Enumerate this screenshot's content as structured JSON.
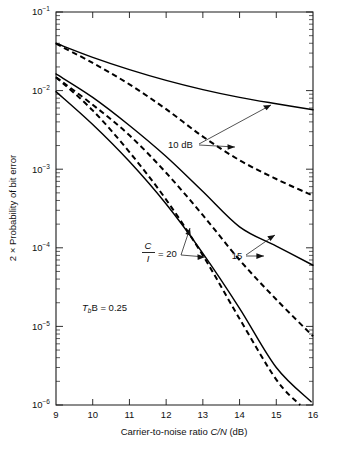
{
  "figure": {
    "background_color": "#ffffff",
    "line_color": "#000000"
  },
  "axes": {
    "x_title_plain_1": "Carrier-to-noise ratio ",
    "x_title_italic": "C/N",
    "x_title_plain_2": " (dB)",
    "y_title": "2 × Probability of bit error",
    "x_ticks": [
      "9",
      "10",
      "11",
      "12",
      "13",
      "14",
      "15",
      "16"
    ],
    "y_tick_mantissa": "10",
    "y_ticks_exponent": [
      "−1",
      "−2",
      "−3",
      "−4",
      "−5",
      "−6"
    ]
  },
  "annotations": {
    "ten_db": "10 dB",
    "ci_numerator": "C",
    "ci_denominator": "I",
    "ci_value": "= 20",
    "fifteen": "15",
    "tsb_symbol": "T",
    "tsb_subscript": "b",
    "tsb_rest": "B = 0.25"
  },
  "chart_data": {
    "type": "line",
    "title": "",
    "xlabel": "Carrier-to-noise ratio C/N (dB)",
    "ylabel": "2 × Probability of bit error",
    "xlim": [
      9,
      16
    ],
    "ylim": [
      1e-06,
      0.1
    ],
    "yscale": "log",
    "xscale": "linear",
    "grid": false,
    "legend": "annotated-inline",
    "xticks": [
      9,
      10,
      11,
      12,
      13,
      14,
      15,
      16
    ],
    "yticks": [
      0.1,
      0.01,
      0.001,
      0.0001,
      1e-05,
      1e-06
    ],
    "note": "T_b B = 0.25",
    "series": [
      {
        "name": "C/I = 10 dB, solid",
        "style": "solid",
        "label": "10 dB",
        "x": [
          9,
          10,
          11,
          12,
          13,
          14,
          15,
          16
        ],
        "y": [
          0.04,
          0.0265,
          0.0185,
          0.0135,
          0.0103,
          0.0082,
          0.0068,
          0.0057
        ]
      },
      {
        "name": "C/I = 10 dB, dashed",
        "style": "dashed",
        "label": "10 dB",
        "x": [
          9,
          10,
          11,
          12,
          13,
          14,
          15,
          16
        ],
        "y": [
          0.0395,
          0.0225,
          0.012,
          0.0058,
          0.0026,
          0.0013,
          0.00075,
          0.00046
        ]
      },
      {
        "name": "C/I = 15 dB, solid",
        "style": "solid",
        "label": "15",
        "x": [
          9,
          10,
          11,
          12,
          13,
          14,
          15,
          16
        ],
        "y": [
          0.0163,
          0.0082,
          0.0036,
          0.00145,
          0.00052,
          0.000185,
          0.000105,
          6e-05
        ]
      },
      {
        "name": "C/I = 15 dB, dashed",
        "style": "dashed",
        "label": "15",
        "x": [
          9,
          10,
          11,
          12,
          13,
          14,
          15,
          16
        ],
        "y": [
          0.0148,
          0.0066,
          0.0027,
          0.0009,
          0.00026,
          7e-05,
          2.2e-05,
          7.5e-06
        ]
      },
      {
        "name": "C/I = 20 dB, solid",
        "style": "solid",
        "label": "C/I = 20",
        "x": [
          9,
          10,
          11,
          12,
          13,
          14,
          15,
          15.95
        ],
        "y": [
          0.0097,
          0.0037,
          0.00125,
          0.00036,
          8.5e-05,
          1.7e-05,
          3e-06,
          1.1e-06
        ]
      },
      {
        "name": "C/I = 20 dB, dashed",
        "style": "dashed",
        "label": "C/I = 20",
        "x": [
          9,
          10,
          11,
          12,
          13,
          14,
          15,
          15.65
        ],
        "y": [
          0.0148,
          0.0056,
          0.00165,
          0.00041,
          8e-05,
          1.25e-05,
          2.1e-06,
          1e-06
        ]
      }
    ]
  }
}
